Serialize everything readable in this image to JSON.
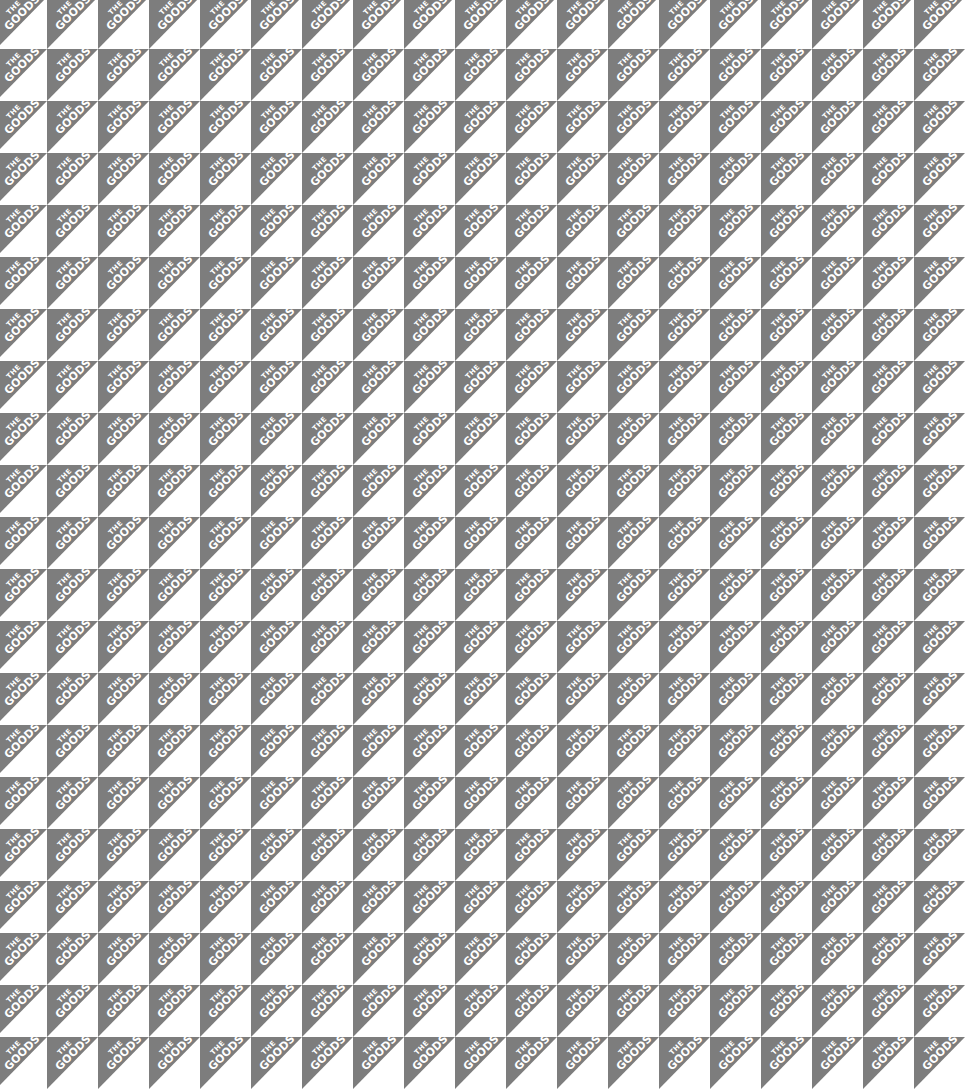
{
  "pattern": {
    "line1": "THE",
    "line2": "GOODS",
    "tile_width": 51,
    "tile_height": 52,
    "columns": 19,
    "rows": 21,
    "colors": {
      "triangle": "#7d7d7d",
      "background": "#ffffff",
      "text": "#ffffff"
    }
  }
}
